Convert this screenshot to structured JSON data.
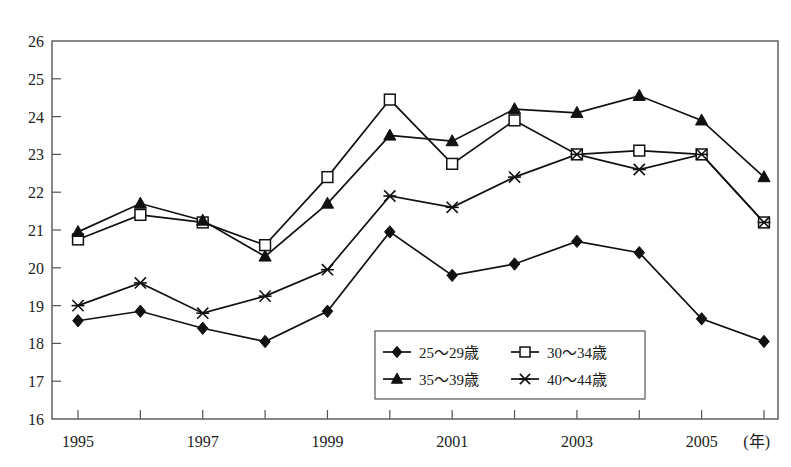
{
  "chart_data": {
    "type": "line",
    "title": "",
    "xlabel": "(年)",
    "ylabel": "(%)",
    "yunit": "(%)",
    "xunit": "(年)",
    "x": [
      1995,
      1996,
      1997,
      1998,
      1999,
      2000,
      2001,
      2002,
      2003,
      2004,
      2005,
      2006
    ],
    "xtick_labels": [
      "1995",
      "",
      "1997",
      "",
      "1999",
      "",
      "2001",
      "",
      "2003",
      "",
      "2005",
      ""
    ],
    "xtick_labels_shown": [
      "1995",
      "1997",
      "1999",
      "2001",
      "2003",
      "2005"
    ],
    "ytick_labels": [
      "26",
      "25",
      "24",
      "23",
      "22",
      "21",
      "20",
      "19",
      "18",
      "17",
      "16"
    ],
    "ylim": [
      16,
      26
    ],
    "xlim": [
      1995,
      2006
    ],
    "grid": false,
    "legend_position": "inside-bottom-center",
    "series": [
      {
        "name": "25～29歳",
        "marker": "diamond",
        "values": [
          18.6,
          18.85,
          18.4,
          18.05,
          18.85,
          20.95,
          19.8,
          20.1,
          20.7,
          20.4,
          18.65,
          18.05
        ]
      },
      {
        "name": "30～34歳",
        "marker": "open-square",
        "values": [
          20.75,
          21.4,
          21.2,
          20.6,
          22.4,
          24.45,
          22.75,
          23.9,
          23.0,
          23.1,
          23.0,
          21.2
        ]
      },
      {
        "name": "35～39歳",
        "marker": "triangle",
        "values": [
          20.95,
          21.7,
          21.25,
          20.3,
          21.7,
          23.5,
          23.35,
          24.2,
          24.1,
          24.55,
          23.9,
          22.4
        ]
      },
      {
        "name": "40～44歳",
        "marker": "star",
        "values": [
          19.0,
          19.6,
          18.8,
          19.25,
          19.95,
          21.9,
          21.6,
          22.4,
          23.0,
          22.6,
          23.0,
          21.2
        ]
      }
    ],
    "legend": [
      {
        "label": "25～29歳",
        "marker": "diamond"
      },
      {
        "label": "30～34歳",
        "marker": "open-square"
      },
      {
        "label": "35～39歳",
        "marker": "triangle"
      },
      {
        "label": "40～44歳",
        "marker": "star"
      }
    ],
    "colors": {
      "line": "#111111",
      "frame": "#555555",
      "text": "#222222",
      "background": "#ffffff"
    }
  }
}
